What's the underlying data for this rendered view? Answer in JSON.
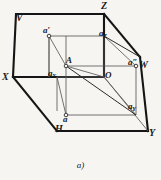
{
  "figure": {
    "caption": "a)",
    "background_color": "#f7f5f1",
    "ink_color": "#1a1a1a",
    "thin_line_color": "#4a4a4a",
    "planes": [
      {
        "key": "V",
        "label": "V",
        "x": 18,
        "y": 18
      },
      {
        "key": "H",
        "label": "H",
        "x": 58,
        "y": 127
      },
      {
        "key": "W",
        "label": "W",
        "x": 142,
        "y": 66
      }
    ],
    "axes": [
      {
        "key": "X",
        "label": "X",
        "x": 3,
        "y": 79
      },
      {
        "key": "Y",
        "label": "Y",
        "x": 150,
        "y": 134
      },
      {
        "key": "Z",
        "label": "Z",
        "x": 104,
        "y": 4
      }
    ],
    "origin": {
      "label": "O",
      "x": 103,
      "y": 79
    },
    "point": {
      "label": "A",
      "x": 64,
      "y": 60
    },
    "projections": [
      {
        "key": "a-prime",
        "label": "a′",
        "x": 45,
        "y": 28,
        "desc": "frontal-projection"
      },
      {
        "key": "a-double",
        "label": "a″",
        "x": 131,
        "y": 61,
        "desc": "profile-projection"
      },
      {
        "key": "a-plain",
        "label": "a",
        "x": 72,
        "y": 113,
        "desc": "horizontal-projection"
      }
    ],
    "intercepts": [
      {
        "key": "aX",
        "base": "a",
        "sub": "X",
        "x": 51,
        "y": 73
      },
      {
        "key": "aY",
        "base": "a",
        "sub": "Y",
        "x": 130,
        "y": 105
      },
      {
        "key": "aZ",
        "base": "a",
        "sub": "Z",
        "x": 101,
        "y": 32
      }
    ],
    "geometry": {
      "outline_points": "57,8 116,8 157,50 157,137 98,137 57,95 57,8",
      "outline_note": "bold hexagonal boundary of three projection planes",
      "vertices": {
        "V_top_left": [
          16,
          14
        ],
        "Z_top": [
          104,
          14
        ],
        "W_right": [
          140,
          57
        ],
        "Y_bottom_right": [
          148,
          131
        ],
        "H_bottom": [
          57,
          131
        ],
        "X_left": [
          13,
          77
        ]
      },
      "inner": {
        "A": [
          66,
          66
        ],
        "O": [
          104,
          77
        ],
        "aP": [
          49,
          36
        ],
        "aPP": [
          136,
          66
        ],
        "a": [
          74,
          115
        ],
        "aX": [
          57,
          77
        ],
        "aY": [
          136,
          115
        ],
        "aZ": [
          104,
          36
        ]
      }
    }
  }
}
